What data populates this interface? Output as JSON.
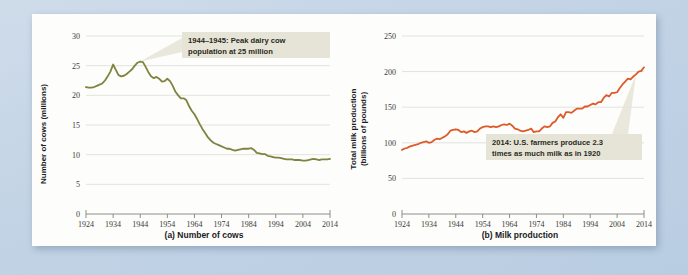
{
  "figure": {
    "background_color": "#c3d4e6",
    "panel_color": "#fdfdfb"
  },
  "chart_data": [
    {
      "id": "cows",
      "type": "line",
      "title": "",
      "caption": "(a) Number of cows",
      "xlabel": "",
      "ylabel": "Number of cows (millions)",
      "ylabel_lines": [
        "Number of cows (millions)"
      ],
      "series_color": "#7f833f",
      "xlim": [
        1924,
        2014
      ],
      "ylim": [
        0,
        30
      ],
      "xticks": [
        1924,
        1934,
        1944,
        1954,
        1964,
        1974,
        1984,
        1994,
        2004,
        2014
      ],
      "yticks": [
        0,
        5,
        10,
        15,
        20,
        25,
        30
      ],
      "grid": true,
      "legend": "none",
      "annotation": {
        "text_lines": [
          "1944–1945: Peak dairy cow",
          "population at 25 million"
        ],
        "full_text": "1944–1945: Peak dairy cow population at 25 million",
        "points_to_year": 1944,
        "points_to_value": 25.7,
        "box_color": "#e6e4d6"
      },
      "x": [
        1924,
        1925,
        1926,
        1927,
        1928,
        1929,
        1930,
        1931,
        1932,
        1933,
        1934,
        1935,
        1936,
        1937,
        1938,
        1939,
        1940,
        1941,
        1942,
        1943,
        1944,
        1945,
        1946,
        1947,
        1948,
        1949,
        1950,
        1951,
        1952,
        1953,
        1954,
        1955,
        1956,
        1957,
        1958,
        1959,
        1960,
        1961,
        1962,
        1963,
        1964,
        1965,
        1966,
        1967,
        1968,
        1969,
        1970,
        1971,
        1972,
        1973,
        1974,
        1975,
        1976,
        1977,
        1978,
        1979,
        1980,
        1981,
        1982,
        1983,
        1984,
        1985,
        1986,
        1987,
        1988,
        1989,
        1990,
        1991,
        1992,
        1993,
        1994,
        1995,
        1996,
        1997,
        1998,
        1999,
        2000,
        2001,
        2002,
        2003,
        2004,
        2005,
        2006,
        2007,
        2008,
        2009,
        2010,
        2011,
        2012,
        2013,
        2014
      ],
      "values": [
        21.4,
        21.3,
        21.3,
        21.4,
        21.6,
        21.8,
        22.0,
        22.5,
        23.2,
        24.0,
        25.2,
        24.3,
        23.4,
        23.2,
        23.3,
        23.6,
        24.0,
        24.4,
        25.0,
        25.5,
        25.7,
        25.6,
        24.8,
        23.9,
        23.2,
        22.9,
        23.1,
        22.8,
        22.3,
        22.4,
        22.8,
        22.4,
        21.6,
        20.6,
        20.0,
        19.5,
        19.5,
        19.2,
        18.2,
        17.4,
        16.8,
        16.0,
        15.1,
        14.3,
        13.6,
        12.9,
        12.4,
        12.0,
        11.8,
        11.6,
        11.4,
        11.2,
        11.0,
        11.0,
        10.8,
        10.7,
        10.8,
        10.9,
        11.0,
        11.0,
        11.0,
        11.1,
        10.8,
        10.3,
        10.2,
        10.1,
        10.1,
        9.8,
        9.7,
        9.6,
        9.5,
        9.5,
        9.4,
        9.3,
        9.2,
        9.2,
        9.2,
        9.1,
        9.1,
        9.1,
        9.0,
        9.0,
        9.1,
        9.2,
        9.3,
        9.2,
        9.1,
        9.2,
        9.2,
        9.2,
        9.3
      ]
    },
    {
      "id": "milk",
      "type": "line",
      "title": "",
      "caption": "(b) Milk production",
      "xlabel": "",
      "ylabel": "Total milk production (billions of pounds)",
      "ylabel_lines": [
        "Total milk production",
        "(billions of pounds)"
      ],
      "series_color": "#de5a29",
      "xlim": [
        1924,
        2014
      ],
      "ylim": [
        0,
        250
      ],
      "xticks": [
        1924,
        1934,
        1944,
        1954,
        1964,
        1974,
        1984,
        1994,
        2004,
        2014
      ],
      "yticks": [
        0,
        50,
        100,
        150,
        200,
        250
      ],
      "grid": true,
      "legend": "none",
      "annotation": {
        "text_lines": [
          "2014: U.S. farmers produce 2.3",
          "times as much milk as in 1920"
        ],
        "full_text": "2014: U.S. farmers produce 2.3 times as much milk as in 1920",
        "points_to_year": 2011,
        "points_to_value": 196,
        "box_color": "#e6e4d6"
      },
      "x": [
        1924,
        1925,
        1926,
        1927,
        1928,
        1929,
        1930,
        1931,
        1932,
        1933,
        1934,
        1935,
        1936,
        1937,
        1938,
        1939,
        1940,
        1941,
        1942,
        1943,
        1944,
        1945,
        1946,
        1947,
        1948,
        1949,
        1950,
        1951,
        1952,
        1953,
        1954,
        1955,
        1956,
        1957,
        1958,
        1959,
        1960,
        1961,
        1962,
        1963,
        1964,
        1965,
        1966,
        1967,
        1968,
        1969,
        1970,
        1971,
        1972,
        1973,
        1974,
        1975,
        1976,
        1977,
        1978,
        1979,
        1980,
        1981,
        1982,
        1983,
        1984,
        1985,
        1986,
        1987,
        1988,
        1989,
        1990,
        1991,
        1992,
        1993,
        1994,
        1995,
        1996,
        1997,
        1998,
        1999,
        2000,
        2001,
        2002,
        2003,
        2004,
        2005,
        2006,
        2007,
        2008,
        2009,
        2010,
        2011,
        2012,
        2013,
        2014
      ],
      "values": [
        90,
        92,
        93,
        95,
        96,
        97,
        98,
        100,
        101,
        102,
        100,
        101,
        104,
        106,
        105,
        107,
        109,
        112,
        117,
        118,
        119,
        118,
        115,
        116,
        114,
        116,
        117,
        115,
        116,
        120,
        122,
        123,
        123,
        122,
        123,
        122,
        123,
        125,
        126,
        125,
        127,
        124,
        120,
        119,
        117,
        116,
        117,
        118,
        120,
        115,
        116,
        116,
        120,
        123,
        122,
        123,
        128,
        130,
        136,
        140,
        135,
        143,
        143,
        142,
        145,
        148,
        148,
        148,
        151,
        151,
        153,
        155,
        154,
        157,
        157,
        163,
        167,
        165,
        170,
        170,
        171,
        177,
        182,
        186,
        190,
        189,
        193,
        196,
        200,
        201,
        206
      ]
    }
  ]
}
